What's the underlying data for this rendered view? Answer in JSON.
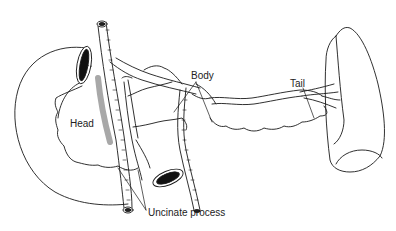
{
  "diagram": {
    "labels": {
      "head": "Head",
      "body": "Body",
      "tail": "Tail",
      "uncinate": "Uncinate process"
    },
    "colors": {
      "line": "#1a1a1a",
      "shading": "#a8a8a8",
      "background": "#ffffff"
    }
  }
}
